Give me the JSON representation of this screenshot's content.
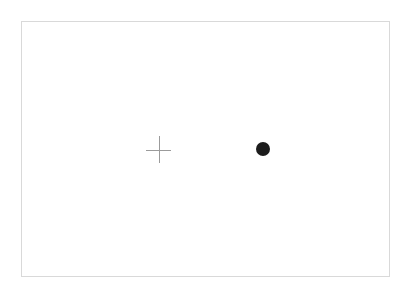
{
  "scene": {
    "title": "Visual fixation stimulus display",
    "background_color": "#ffffff"
  },
  "frame": {
    "name": "stimulus-frame",
    "border_color": "#d9d9d9",
    "fill_color": "#ffffff",
    "x": 21,
    "y": 21,
    "width": 369,
    "height": 256
  },
  "fixation_cross": {
    "name": "fixation-cross",
    "symbol": "+",
    "color": "#9b9b9b",
    "center_x": 158,
    "center_y": 149,
    "arm_width": 25,
    "arm_height": 27,
    "stroke_width": 1
  },
  "target_dot": {
    "name": "target-dot",
    "shape": "filled-circle",
    "color": "#1c1c1c",
    "center_x": 263,
    "center_y": 149,
    "diameter": 14
  },
  "labels": {
    "fixation_cross_alt": "fixation cross",
    "target_dot_alt": "target dot",
    "frame_alt": "display frame"
  }
}
